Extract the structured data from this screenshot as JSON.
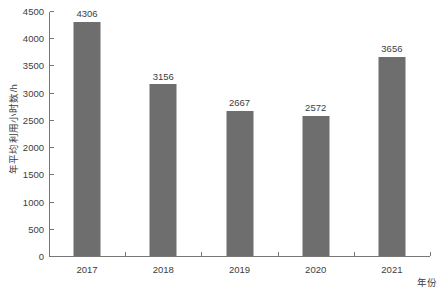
{
  "chart_data": {
    "type": "bar",
    "title": "",
    "categories": [
      "2017",
      "2018",
      "2019",
      "2020",
      "2021"
    ],
    "values": [
      4306,
      3156,
      2667,
      2572,
      3656
    ],
    "series": [
      {
        "name": "年平均利用小时数",
        "values": [
          4306,
          3156,
          2667,
          2572,
          3656
        ]
      }
    ],
    "data_labels": [
      "4306",
      "3156",
      "2667",
      "2572",
      "3656"
    ],
    "xlabel": "年份",
    "ylabel": "年平均利用小时数/h",
    "ylim": [
      0,
      4500
    ],
    "yticks": [
      0,
      500,
      1000,
      1500,
      2000,
      2500,
      3000,
      3500,
      4000,
      4500
    ],
    "ytick_labels": [
      "0",
      "500",
      "1000",
      "1500",
      "2000",
      "2500",
      "3000",
      "3500",
      "4000",
      "4500"
    ],
    "xtick_labels": [
      "2017",
      "2018",
      "2019",
      "2020",
      "2021"
    ],
    "grid": false,
    "legend": null,
    "legend_position": "none",
    "bar_color": "#6e6e6e",
    "axis_color": "#777777",
    "text_color": "#3d3d3d",
    "background_color": "#ffffff"
  }
}
